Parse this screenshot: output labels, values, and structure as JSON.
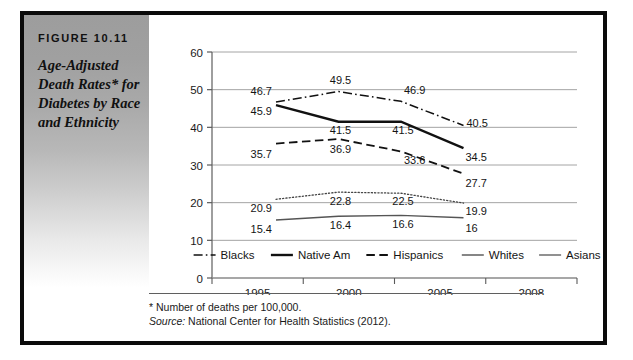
{
  "figure": {
    "label": "FIGURE 10.11",
    "title": "Age-Adjusted Death Rates* for Diabetes by Race and Ethnicity",
    "footnote_marker": "*",
    "footnote_text": "Number of deaths per 100,000.",
    "source_label": "Source:",
    "source_text": "National Center for Health Statistics (2012)."
  },
  "chart_data": {
    "type": "line",
    "title": "",
    "subtitle": "",
    "xlabel": "",
    "ylabel": "",
    "categories": [
      "1995",
      "2000",
      "2005",
      "2008"
    ],
    "ylim": [
      0,
      60
    ],
    "yticks": [
      0,
      10,
      20,
      30,
      40,
      50,
      60
    ],
    "ytick_labels": [
      "0",
      "10",
      "20",
      "30",
      "40",
      "50",
      "60"
    ],
    "grid": true,
    "grid_axis": "y",
    "legend_position": "bottom",
    "series": [
      {
        "name": "Blacks",
        "style": "dash-dot",
        "color": "#111111",
        "width": 1.5,
        "values": [
          46.7,
          49.5,
          46.9,
          40.5
        ],
        "labels": [
          "46.7",
          "49.5",
          "46.9",
          "40.5"
        ]
      },
      {
        "name": "Native Am",
        "style": "solid-thick",
        "color": "#111111",
        "width": 2.4,
        "values": [
          45.9,
          41.5,
          41.5,
          34.5
        ],
        "labels": [
          "45.9",
          "41.5",
          "41.5",
          "34.5"
        ]
      },
      {
        "name": "Hispanics",
        "style": "dashed",
        "color": "#111111",
        "width": 1.8,
        "values": [
          35.7,
          36.9,
          33.6,
          27.7
        ],
        "labels": [
          "35.7",
          "36.9",
          "33.6",
          "27.7"
        ]
      },
      {
        "name": "Whites",
        "style": "dotted",
        "color": "#444444",
        "width": 1.3,
        "values": [
          20.9,
          22.8,
          22.5,
          19.9
        ],
        "labels": [
          "20.9",
          "22.8",
          "22.5",
          "19.9"
        ]
      },
      {
        "name": "Asians",
        "style": "solid-thin",
        "color": "#555555",
        "width": 1.3,
        "values": [
          15.4,
          16.4,
          16.6,
          16
        ],
        "labels": [
          "15.4",
          "16.4",
          "16.6",
          "16"
        ]
      }
    ]
  }
}
